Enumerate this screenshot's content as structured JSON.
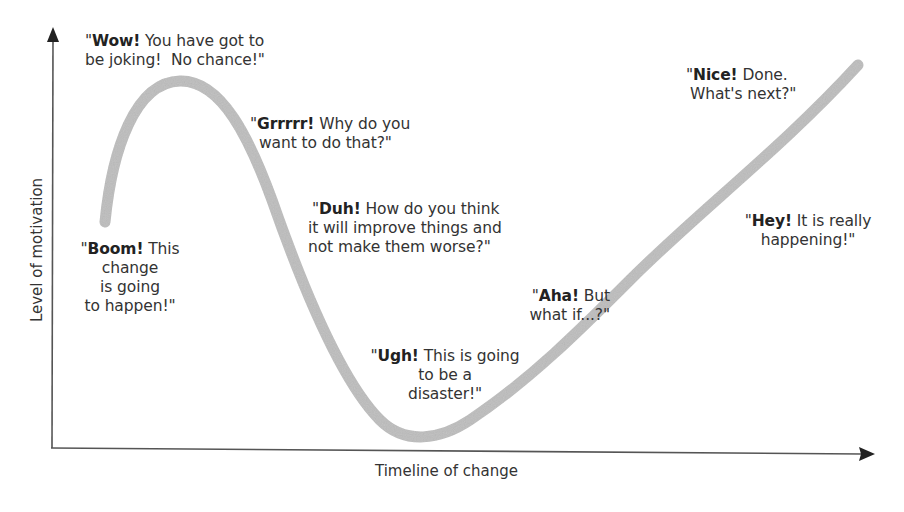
{
  "diagram": {
    "type": "change-curve",
    "axes": {
      "y_label": "Level of motivation",
      "x_label": "Timeline of change"
    },
    "colors": {
      "curve": "#bdbdbd",
      "axes": "#555555",
      "text": "#333333"
    },
    "stages": [
      {
        "id": "boom",
        "keyword": "Boom!",
        "lines": [
          " This",
          "change",
          "is going",
          "to happen!\""
        ]
      },
      {
        "id": "wow",
        "keyword": "Wow!",
        "lines": [
          " You have got to",
          "be joking!  No chance!\""
        ]
      },
      {
        "id": "grrrr",
        "keyword": "Grrrrr!",
        "lines": [
          " Why do you",
          "want to do that?\""
        ]
      },
      {
        "id": "duh",
        "keyword": "Duh!",
        "lines": [
          " How do you think",
          "it will improve things and",
          "not make them worse?\""
        ]
      },
      {
        "id": "ugh",
        "keyword": "Ugh!",
        "lines": [
          " This is going",
          "to be a",
          "disaster!\""
        ]
      },
      {
        "id": "aha",
        "keyword": "Aha!",
        "lines": [
          " But",
          "what if...?\""
        ]
      },
      {
        "id": "hey",
        "keyword": "Hey!",
        "lines": [
          " It is really",
          "happening!\""
        ]
      },
      {
        "id": "nice",
        "keyword": "Nice!",
        "lines": [
          " Done.",
          "What's next?\""
        ]
      }
    ],
    "open_quote": "\""
  }
}
